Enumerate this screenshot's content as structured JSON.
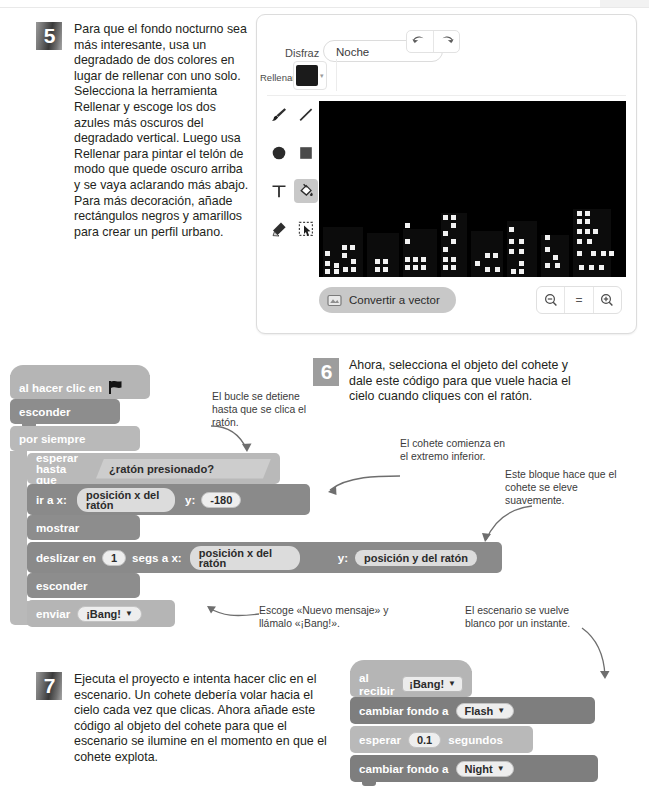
{
  "steps": {
    "five": {
      "number": "5",
      "text": "Para que el fondo nocturno sea más interesante, usa un degradado de dos colores en lugar de rellenar con uno solo. Selecciona la herramienta Rellenar y escoge los dos azules más oscuros del degradado vertical. Luego usa Rellenar para pintar el telón de modo que quede oscuro arriba y se vaya aclarando más abajo. Para más decoración, añade rectángulos negros y amarillos para crear un perfil urbano."
    },
    "six": {
      "number": "6",
      "text": "Ahora, selecciona el objeto del cohete y dale este código para que vuele hacia el cielo cuando cliques con el ratón."
    },
    "seven": {
      "number": "7",
      "text": "Ejecuta el proyecto e intenta hacer clic en el escenario. Un cohete debería volar hacia el cielo cada vez que clicas. Ahora añade este código al objeto del cohete para que el escenario se ilumine en el momento en que el cohete explota."
    }
  },
  "paint_editor": {
    "costume_label": "Disfraz",
    "costume_name": "Noche",
    "fill_label": "Rellenar",
    "fill_color": "#1b1b1b",
    "undo_icon": "undo-arrow-icon",
    "redo_icon": "redo-arrow-icon",
    "tools": [
      {
        "name": "brush-tool",
        "selected": false
      },
      {
        "name": "line-tool",
        "selected": false
      },
      {
        "name": "circle-tool",
        "selected": false
      },
      {
        "name": "rectangle-tool",
        "selected": false
      },
      {
        "name": "text-tool",
        "selected": false
      },
      {
        "name": "fill-tool",
        "selected": true
      },
      {
        "name": "eraser-tool",
        "selected": false
      },
      {
        "name": "select-tool",
        "selected": false
      }
    ],
    "convert_button": "Convertir a vector",
    "zoom_out": "−",
    "zoom_reset": "=",
    "zoom_in": "+",
    "canvas_bg": "#000000"
  },
  "script_one": {
    "blocks": [
      {
        "id": "hat",
        "label": "al hacer clic en",
        "icon": "green-flag-icon"
      },
      {
        "id": "hide1",
        "label": "esconder"
      },
      {
        "id": "forever",
        "label": "por siempre"
      },
      {
        "id": "waituntil",
        "label1": "esperar",
        "label2": "hasta que",
        "condition": "¿ratón presionado?"
      },
      {
        "id": "goto",
        "label": "ir a x:",
        "x_value": "posición x del ratón",
        "y_label": "y:",
        "y_value": "-180"
      },
      {
        "id": "show",
        "label": "mostrar"
      },
      {
        "id": "glide",
        "label_a": "deslizar en",
        "secs": "1",
        "label_b": "segs a x:",
        "x_value": "posición x del ratón",
        "y_label": "y:",
        "y_value": "posición y del ratón"
      },
      {
        "id": "hide2",
        "label": "esconder"
      },
      {
        "id": "broadcast",
        "label": "enviar",
        "message": "¡Bang!"
      }
    ]
  },
  "script_two": {
    "blocks": [
      {
        "id": "whenreceive",
        "label": "al recibir",
        "message": "¡Bang!"
      },
      {
        "id": "switch1",
        "label": "cambiar fondo a",
        "backdrop": "Flash"
      },
      {
        "id": "wait",
        "label_a": "esperar",
        "seconds": "0.1",
        "label_b": "segundos"
      },
      {
        "id": "switch2",
        "label": "cambiar fondo a",
        "backdrop": "Night"
      }
    ]
  },
  "annotations": [
    {
      "id": "loop-stops",
      "text": "El bucle se detiene hasta que se clica el ratón."
    },
    {
      "id": "rocket-start",
      "text": "El cohete comienza en el extremo inferior."
    },
    {
      "id": "smooth-rise",
      "text": "Este bloque hace que el cohete se eleve suavemente."
    },
    {
      "id": "new-message",
      "text": "Escoge «Nuevo mensaje» y llámalo «¡Bang!»."
    },
    {
      "id": "stage-white",
      "text": "El escenario se vuelve blanco por un instante."
    }
  ],
  "colors": {
    "text": "#231f20",
    "annotation": "#3b3b3b",
    "block_light": "#b9b9b9",
    "block_dark": "#8a8a8a",
    "panel_border": "#dcdcdc"
  }
}
